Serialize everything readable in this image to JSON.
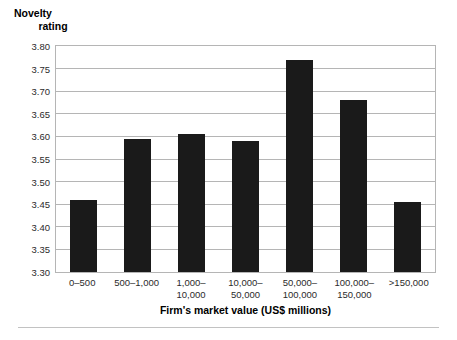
{
  "chart_data": {
    "type": "bar",
    "title": "",
    "ylabel": "Novelty rating",
    "ylabel_lines": [
      "Novelty",
      "rating"
    ],
    "xlabel": "Firm's market value (US$ millions)",
    "categories": [
      "0–500",
      "500–1,000",
      "1,000–10,000",
      "10,000–50,000",
      "50,000–100,000",
      "100,000–150,000",
      ">150,000"
    ],
    "category_lines": [
      [
        "0–500",
        ""
      ],
      [
        "500–1,000",
        ""
      ],
      [
        "1,000–",
        "10,000"
      ],
      [
        "10,000–",
        "50,000"
      ],
      [
        "50,000–",
        "100,000"
      ],
      [
        "100,000–",
        "150,000"
      ],
      [
        ">150,000",
        ""
      ]
    ],
    "values": [
      3.46,
      3.595,
      3.605,
      3.59,
      3.77,
      3.68,
      3.455
    ],
    "ylim": [
      3.3,
      3.8
    ],
    "yticks": [
      3.3,
      3.35,
      3.4,
      3.45,
      3.5,
      3.55,
      3.6,
      3.65,
      3.7,
      3.75,
      3.8
    ],
    "ytick_labels": [
      "3.30",
      "3.35",
      "3.40",
      "3.45",
      "3.50",
      "3.55",
      "3.60",
      "3.65",
      "3.70",
      "3.75",
      "3.80"
    ],
    "grid": true,
    "legend": null,
    "bar_color": "#1a1a1a",
    "grid_color": "#b5b5b5",
    "background_color": "#ffffff"
  }
}
